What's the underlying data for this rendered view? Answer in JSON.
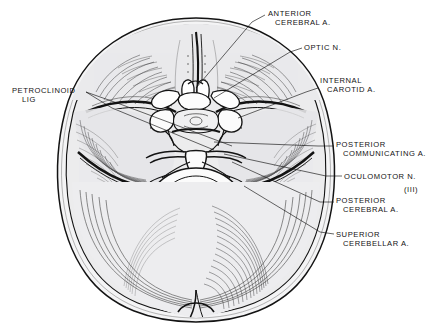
{
  "figure": {
    "background_color": "#ffffff",
    "ink_color": "#131313",
    "fill_color": "#ececed",
    "shade_color": "#d8d8da"
  },
  "labels": [
    {
      "id": "anterior-cerebral-a",
      "line1": "ANTERIOR",
      "line2": "CEREBRAL A.",
      "x": 268,
      "y": 9,
      "indent": 1
    },
    {
      "id": "optic-n",
      "line1": "OPTIC N.",
      "line2": "",
      "x": 304,
      "y": 43,
      "indent": 0
    },
    {
      "id": "internal-carotid-a",
      "line1": "INTERNAL",
      "line2": "CAROTID A.",
      "x": 320,
      "y": 76,
      "indent": 1
    },
    {
      "id": "petroclinoid-lig",
      "line1": "PETROCLINOID",
      "line2": "LIG",
      "x": 12,
      "y": 86,
      "indent": 2
    },
    {
      "id": "posterior-communicating-a",
      "line1": "POSTERIOR",
      "line2": "COMMUNICATING A.",
      "x": 336,
      "y": 140,
      "indent": 1
    },
    {
      "id": "oculomotor-n",
      "line1": "OCULOMOTOR N.",
      "line2": "",
      "x": 344,
      "y": 172,
      "indent": 0
    },
    {
      "id": "oculomotor-n-numeral",
      "line1": "(III)",
      "line2": "",
      "x": 404,
      "y": 185,
      "indent": 0
    },
    {
      "id": "posterior-cerebral-a",
      "line1": "POSTERIOR",
      "line2": "CEREBRAL A.",
      "x": 336,
      "y": 196,
      "indent": 1
    },
    {
      "id": "superior-cerebellar-a",
      "line1": "SUPERIOR",
      "line2": "CEREBELLAR A.",
      "x": 336,
      "y": 230,
      "indent": 1
    }
  ]
}
